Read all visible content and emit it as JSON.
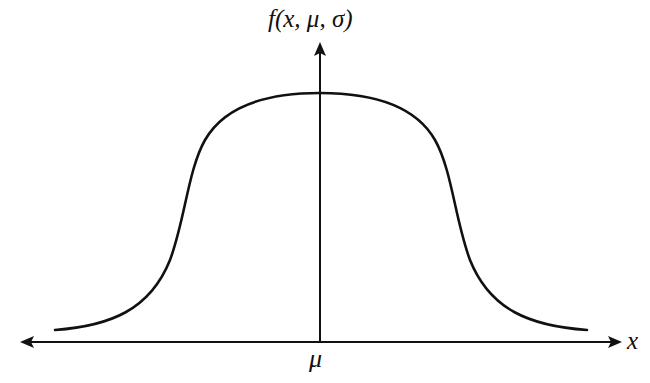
{
  "diagram": {
    "y_axis_label": "f(x, μ, σ)",
    "x_axis_label": "x",
    "center_tick_label": "μ",
    "colors": {
      "stroke": "#111111",
      "background": "#ffffff"
    },
    "curve": {
      "description": "Symmetric, flat-topped (platykurtic) bell curve centered at μ",
      "path": "M 55 330 C 110 326, 150 310, 170 260 C 185 220, 188 170, 205 140 C 225 105, 270 93, 320 93 C 370 93, 415 105, 435 140 C 452 170, 455 220, 470 260 C 490 310, 530 326, 587 330",
      "stroke_width": 2.6
    },
    "axes": {
      "x_axis": {
        "y": 342,
        "x_start": 20,
        "x_end": 622,
        "arrow_both_ends": true
      },
      "y_axis": {
        "x": 320,
        "y_start": 342,
        "y_end": 42,
        "arrow_top": true
      }
    }
  }
}
